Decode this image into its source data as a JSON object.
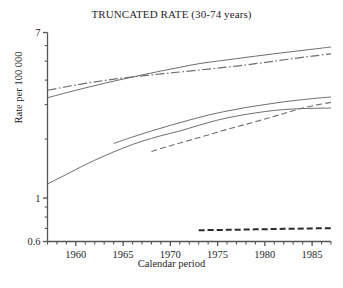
{
  "chart_data": {
    "type": "line",
    "title": "TRUNCATED RATE (30-74 years)",
    "xlabel": "Calendar period",
    "ylabel": "Rate per 100 000",
    "yscale": "log",
    "ylim": [
      0.6,
      7
    ],
    "xlim": [
      1957,
      1987
    ],
    "grid": false,
    "legend": "none",
    "y_tick_labels": [
      "7",
      "1",
      "0.6"
    ],
    "y_tick_values": [
      7,
      1,
      0.6
    ],
    "y_minor_ticks": [
      6,
      5,
      4,
      3,
      2,
      0.9,
      0.8,
      0.7
    ],
    "x_tick_labels": [
      "1960",
      "1965",
      "1970",
      "1975",
      "1980",
      "1985"
    ],
    "x_tick_values": [
      1960,
      1965,
      1970,
      1975,
      1980,
      1985
    ],
    "x_minor_tick_step": 1,
    "series": [
      {
        "name": "upper-solid",
        "style": "solid",
        "x": [
          1957,
          1959,
          1961,
          1963,
          1965,
          1967,
          1969,
          1971,
          1973,
          1975,
          1977,
          1979,
          1981,
          1983,
          1985,
          1987
        ],
        "values": [
          3.25,
          3.45,
          3.65,
          3.85,
          4.05,
          4.25,
          4.45,
          4.65,
          4.85,
          5.0,
          5.15,
          5.3,
          5.45,
          5.6,
          5.75,
          5.9
        ]
      },
      {
        "name": "upper-dashdot",
        "style": "dashdot",
        "x": [
          1957,
          1959,
          1961,
          1963,
          1965,
          1967,
          1969,
          1971,
          1973,
          1975,
          1977,
          1979,
          1981,
          1983,
          1985,
          1987
        ],
        "values": [
          3.55,
          3.7,
          3.85,
          3.98,
          4.1,
          4.2,
          4.3,
          4.4,
          4.5,
          4.6,
          4.72,
          4.85,
          5.0,
          5.15,
          5.3,
          5.45
        ]
      },
      {
        "name": "middle-solid-full",
        "style": "solid",
        "x": [
          1957,
          1959,
          1961,
          1963,
          1965,
          1967,
          1969,
          1971,
          1973,
          1975,
          1977,
          1979,
          1981,
          1983,
          1985,
          1987
        ],
        "values": [
          1.18,
          1.32,
          1.48,
          1.64,
          1.8,
          1.95,
          2.08,
          2.2,
          2.35,
          2.5,
          2.62,
          2.72,
          2.8,
          2.85,
          2.87,
          2.88
        ]
      },
      {
        "name": "middle-solid-partial",
        "style": "solid",
        "x": [
          1964,
          1966,
          1968,
          1970,
          1972,
          1974,
          1976,
          1978,
          1980,
          1982,
          1984,
          1986,
          1987
        ],
        "values": [
          1.9,
          2.05,
          2.2,
          2.35,
          2.5,
          2.65,
          2.78,
          2.9,
          3.0,
          3.1,
          3.18,
          3.25,
          3.28
        ]
      },
      {
        "name": "middle-dashed",
        "style": "dashed",
        "x": [
          1968,
          1970,
          1972,
          1974,
          1976,
          1978,
          1980,
          1982,
          1984,
          1986,
          1987
        ],
        "values": [
          1.73,
          1.85,
          1.97,
          2.1,
          2.24,
          2.38,
          2.53,
          2.7,
          2.88,
          3.02,
          3.08
        ]
      },
      {
        "name": "bottom-dashed",
        "style": "dashed-bold",
        "x": [
          1973,
          1976,
          1979,
          1982,
          1985,
          1987
        ],
        "values": [
          0.685,
          0.688,
          0.692,
          0.696,
          0.7,
          0.702
        ]
      }
    ]
  }
}
